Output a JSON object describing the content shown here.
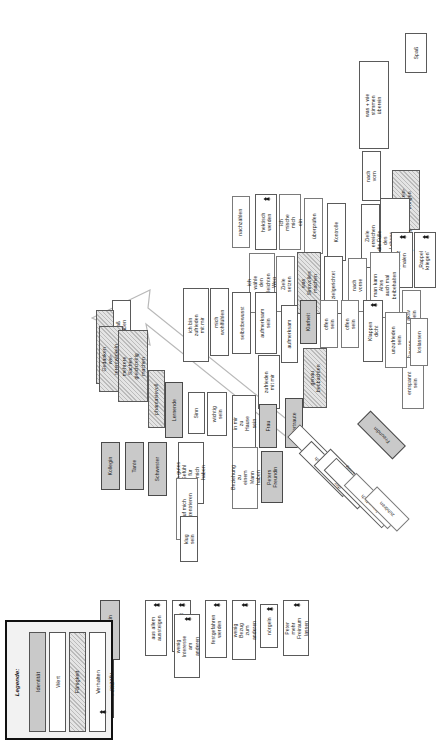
{
  "poster": {
    "orientation": "landscape-rotated-90ccw",
    "legend": {
      "title": "Legende:",
      "items": [
        {
          "label": "Identität",
          "type": "identitaet"
        },
        {
          "label": "Wert",
          "type": "wert"
        },
        {
          "label": "Fähigkeit",
          "type": "faehigkeit"
        },
        {
          "label": "Verhalten",
          "type": "verhalten"
        },
        {
          "label": "negativ",
          "type": "negativ"
        }
      ]
    },
    "colors": {
      "identitaet": "#c9c9c9",
      "wert": "#ffffff",
      "faehigkeit": "#e4e4e4",
      "verhalten": "#ffffff",
      "frame": "#111111"
    },
    "nodes": [
      {
        "id": "n01",
        "label": "Spaß",
        "type": "wert",
        "x": 405,
        "y": 33,
        "w": 22,
        "h": 40
      },
      {
        "id": "n02",
        "label": "was + wie\nstimmen\nüberein",
        "type": "wert",
        "x": 359,
        "y": 61,
        "w": 30,
        "h": 88
      },
      {
        "id": "n03",
        "label": "nach vorn",
        "type": "wert",
        "x": 362,
        "y": 151,
        "w": 19,
        "h": 50
      },
      {
        "id": "n04",
        "label": "Licht rein-\nbringen",
        "type": "faehigkeit",
        "x": 392,
        "y": 170,
        "w": 28,
        "h": 60
      },
      {
        "id": "n05",
        "label": "Ziele erreichen",
        "type": "wert",
        "x": 361,
        "y": 204,
        "w": 19,
        "h": 64
      },
      {
        "id": "n06",
        "label": "die Fülle des\nLebens erleben\nu. genießen",
        "type": "wert",
        "x": 380,
        "y": 198,
        "w": 30,
        "h": 86
      },
      {
        "id": "n07",
        "label": "schwarz\nmalen",
        "type": "negativ",
        "x": 391,
        "y": 232,
        "w": 22,
        "h": 56,
        "neg": true
      },
      {
        "id": "n08",
        "label": "„Rappel\nkriegen“",
        "type": "negativ",
        "x": 414,
        "y": 232,
        "w": 22,
        "h": 56,
        "neg": true
      },
      {
        "id": "n09",
        "label": "nachzählen",
        "type": "verhalten",
        "x": 232,
        "y": 196,
        "w": 18,
        "h": 52
      },
      {
        "id": "n10",
        "label": "hektisch\nwerden",
        "type": "negativ",
        "x": 255,
        "y": 194,
        "w": 22,
        "h": 56,
        "neg": true
      },
      {
        "id": "n11",
        "label": "ich mische\nmich ein",
        "type": "verhalten",
        "x": 279,
        "y": 194,
        "w": 22,
        "h": 56
      },
      {
        "id": "n12",
        "label": "überprüfen",
        "type": "verhalten",
        "x": 304,
        "y": 198,
        "w": 19,
        "h": 56
      },
      {
        "id": "n13",
        "label": "Kontrolle",
        "type": "wert",
        "x": 327,
        "y": 203,
        "w": 19,
        "h": 58
      },
      {
        "id": "n14",
        "label": "ich wähle den\nleichten Weg",
        "type": "verhalten",
        "x": 249,
        "y": 253,
        "w": 26,
        "h": 60
      },
      {
        "id": "n15",
        "label": "Ziele setzen",
        "type": "verhalten",
        "x": 276,
        "y": 256,
        "w": 19,
        "h": 56
      },
      {
        "id": "n16",
        "label": "was Sinnvolles\nmachen",
        "type": "faehigkeit",
        "x": 297,
        "y": 252,
        "w": 24,
        "h": 62
      },
      {
        "id": "n17",
        "label": "zielgerichtet",
        "type": "wert",
        "x": 324,
        "y": 256,
        "w": 19,
        "h": 58
      },
      {
        "id": "n18",
        "label": "nach vorne",
        "type": "verhalten",
        "x": 348,
        "y": 258,
        "w": 19,
        "h": 54
      },
      {
        "id": "n19",
        "label": "man kann Altes\nauch mal\nbeibehalten",
        "type": "verhalten",
        "x": 370,
        "y": 252,
        "w": 30,
        "h": 66
      },
      {
        "id": "n20",
        "label": "aktiv sein",
        "type": "verhalten",
        "x": 402,
        "y": 290,
        "w": 19,
        "h": 50
      },
      {
        "id": "n21",
        "label": "Pausen\ngenießen",
        "type": "verhalten",
        "x": 402,
        "y": 323,
        "w": 22,
        "h": 52
      },
      {
        "id": "n22",
        "label": "entspannt\nsein",
        "type": "verhalten",
        "x": 402,
        "y": 357,
        "w": 22,
        "h": 52
      },
      {
        "id": "n23",
        "label": "ich bin zufrieden\nmit mir",
        "type": "wert",
        "x": 183,
        "y": 288,
        "w": 26,
        "h": 74
      },
      {
        "id": "n24",
        "label": "mich wohlfühlen",
        "type": "wert",
        "x": 210,
        "y": 288,
        "w": 19,
        "h": 68
      },
      {
        "id": "n25",
        "label": "selbstbewusst",
        "type": "wert",
        "x": 232,
        "y": 292,
        "w": 19,
        "h": 62
      },
      {
        "id": "n26",
        "label": "aufmerksam\nsein",
        "type": "wert",
        "x": 255,
        "y": 292,
        "w": 22,
        "h": 62
      },
      {
        "id": "n27",
        "label": "aufmerksam",
        "type": "wert",
        "x": 281,
        "y": 305,
        "w": 17,
        "h": 58
      },
      {
        "id": "n28",
        "label": "Klarheit",
        "type": "identitaet",
        "x": 300,
        "y": 300,
        "w": 17,
        "h": 44
      },
      {
        "id": "n29",
        "label": "offen sein",
        "type": "verhalten",
        "x": 320,
        "y": 300,
        "w": 18,
        "h": 48
      },
      {
        "id": "n30",
        "label": "offen sein",
        "type": "verhalten",
        "x": 341,
        "y": 300,
        "w": 18,
        "h": 48
      },
      {
        "id": "n31",
        "label": "genau\nbeobachten",
        "type": "faehigkeit",
        "x": 303,
        "y": 348,
        "w": 24,
        "h": 60
      },
      {
        "id": "n32",
        "label": "Klappen dicht",
        "type": "negativ",
        "x": 363,
        "y": 300,
        "w": 20,
        "h": 62,
        "neg": true
      },
      {
        "id": "n33",
        "label": "unzufrieden\nsein",
        "type": "verhalten",
        "x": 385,
        "y": 312,
        "w": 22,
        "h": 56
      },
      {
        "id": "n34",
        "label": "loslassen",
        "type": "verhalten",
        "x": 410,
        "y": 318,
        "w": 18,
        "h": 48
      },
      {
        "id": "n35",
        "label": "zufrieden\nmit mir",
        "type": "wert",
        "x": 258,
        "y": 355,
        "w": 22,
        "h": 54
      },
      {
        "id": "n36",
        "label": "in mir zu\nHause sein",
        "type": "wert",
        "x": 232,
        "y": 395,
        "w": 24,
        "h": 56
      },
      {
        "id": "n37",
        "label": "Frau",
        "type": "identitaet",
        "x": 259,
        "y": 404,
        "w": 18,
        "h": 44
      },
      {
        "id": "n38",
        "label": "Vertraute",
        "type": "identitaet",
        "x": 285,
        "y": 398,
        "w": 18,
        "h": 50
      },
      {
        "id": "n39",
        "label": "Sinn",
        "type": "wert",
        "x": 188,
        "y": 392,
        "w": 17,
        "h": 42
      },
      {
        "id": "n40",
        "label": "wichtig\nsein",
        "type": "wert",
        "x": 207,
        "y": 392,
        "w": 20,
        "h": 44
      },
      {
        "id": "n41",
        "label": "Lernende",
        "type": "identitaet",
        "x": 165,
        "y": 382,
        "w": 18,
        "h": 56
      },
      {
        "id": "n42",
        "label": "phantasievoll",
        "type": "faehigkeit",
        "x": 148,
        "y": 370,
        "w": 17,
        "h": 58
      },
      {
        "id": "n43",
        "label": "ein gutes\nGefühl für\nmich haben",
        "type": "wert",
        "x": 178,
        "y": 442,
        "w": 26,
        "h": 62
      },
      {
        "id": "n44",
        "label": "auf mich\nkonzentrieren",
        "type": "verhalten",
        "x": 176,
        "y": 478,
        "w": 22,
        "h": 62
      },
      {
        "id": "n45",
        "label": "klug sein",
        "type": "wert",
        "x": 180,
        "y": 516,
        "w": 18,
        "h": 46
      },
      {
        "id": "n46",
        "label": "Beziehung zu\neinem Mann\nhaben",
        "type": "verhalten",
        "x": 232,
        "y": 447,
        "w": 26,
        "h": 62
      },
      {
        "id": "n47",
        "label": "Peters\nFreundin",
        "type": "identitaet",
        "x": 261,
        "y": 451,
        "w": 22,
        "h": 52
      },
      {
        "id": "n48",
        "label": "Kollegin",
        "type": "identitaet",
        "x": 101,
        "y": 442,
        "w": 19,
        "h": 48
      },
      {
        "id": "n49",
        "label": "Tante",
        "type": "identitaet",
        "x": 125,
        "y": 442,
        "w": 19,
        "h": 48
      },
      {
        "id": "n50",
        "label": "Schwester",
        "type": "identitaet",
        "x": 148,
        "y": 442,
        "w": 19,
        "h": 54
      },
      {
        "id": "n51",
        "label": "Spaß haben",
        "type": "wert",
        "x": 112,
        "y": 300,
        "w": 19,
        "h": 54
      },
      {
        "id": "n52",
        "label": "Überblick behalten",
        "type": "faehigkeit",
        "x": 96,
        "y": 310,
        "w": 18,
        "h": 74
      },
      {
        "id": "n53",
        "label": "Gedanken wei-\nterentwickeln",
        "type": "faehigkeit",
        "x": 99,
        "y": 326,
        "w": 24,
        "h": 66
      },
      {
        "id": "n54",
        "label": "mehrere Sachen\ngleichzeitig\nmachen",
        "type": "faehigkeit",
        "x": 118,
        "y": 330,
        "w": 30,
        "h": 72
      },
      {
        "id": "n55",
        "label": "Konkurrentin",
        "type": "identitaet",
        "x": 100,
        "y": 600,
        "w": 20,
        "h": 60
      },
      {
        "id": "n56",
        "label": "Freundin von\nPapa Peter",
        "type": "identitaet",
        "x": 90,
        "y": 660,
        "w": 24,
        "h": 58
      },
      {
        "id": "n57",
        "label": "aus allem\naussteigen",
        "type": "negativ",
        "x": 145,
        "y": 600,
        "w": 22,
        "h": 56,
        "neg": true
      },
      {
        "id": "n58",
        "label": "Rückschritt",
        "type": "negativ",
        "x": 172,
        "y": 600,
        "w": 19,
        "h": 52,
        "neg": true
      },
      {
        "id": "n59",
        "label": "wenig Interesse\nam anderen",
        "type": "negativ",
        "x": 174,
        "y": 614,
        "w": 26,
        "h": 64,
        "neg": true
      },
      {
        "id": "n60",
        "label": "festgefahren\nwerden",
        "type": "negativ",
        "x": 205,
        "y": 600,
        "w": 22,
        "h": 58,
        "neg": true
      },
      {
        "id": "n61",
        "label": "wenig Bezug\nzum anderen",
        "type": "negativ",
        "x": 232,
        "y": 600,
        "w": 24,
        "h": 60,
        "neg": true
      },
      {
        "id": "n62",
        "label": "nörgeln",
        "type": "negativ",
        "x": 260,
        "y": 604,
        "w": 18,
        "h": 44,
        "neg": true
      },
      {
        "id": "n63",
        "label": "Peter mehr\nFreiraum\nlassen",
        "type": "negativ",
        "x": 283,
        "y": 600,
        "w": 26,
        "h": 56,
        "neg": true
      },
      {
        "id": "n64",
        "label": "zueinander stehen",
        "type": "wert",
        "x": 310,
        "y": 420,
        "w": 18,
        "h": 72,
        "rot": -45
      },
      {
        "id": "n65",
        "label": "gastfreundlich",
        "type": "wert",
        "x": 318,
        "y": 438,
        "w": 18,
        "h": 62,
        "rot": -45
      },
      {
        "id": "n66",
        "label": "der andere ist\nwichtig",
        "type": "wert",
        "x": 332,
        "y": 448,
        "w": 24,
        "h": 62,
        "rot": -45
      },
      {
        "id": "n67",
        "label": "liebevolle Beziehung",
        "type": "wert",
        "x": 350,
        "y": 452,
        "w": 18,
        "h": 82,
        "rot": -45
      },
      {
        "id": "n68",
        "label": "freundlich sein",
        "type": "verhalten",
        "x": 363,
        "y": 470,
        "w": 18,
        "h": 62,
        "rot": -45
      },
      {
        "id": "n69",
        "label": "zuhören",
        "type": "verhalten",
        "x": 378,
        "y": 486,
        "w": 18,
        "h": 46,
        "rot": -45
      },
      {
        "id": "n70",
        "label": "Freundin",
        "type": "identitaet",
        "x": 372,
        "y": 410,
        "w": 19,
        "h": 50,
        "rot": -45
      }
    ]
  }
}
